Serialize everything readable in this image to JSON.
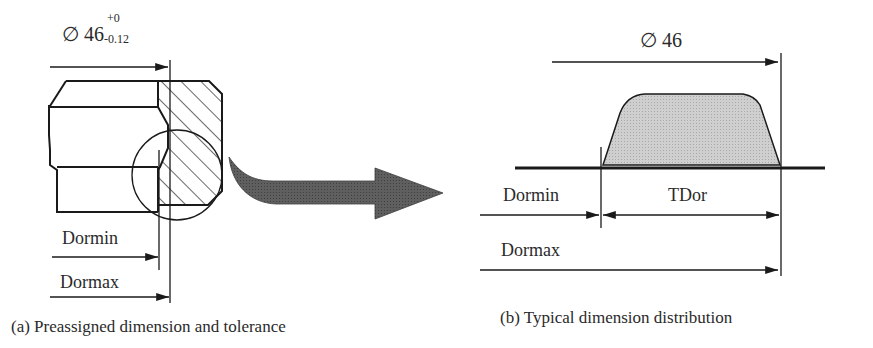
{
  "panel_a": {
    "dimension_symbol": "∅",
    "dimension_value": "46",
    "tolerance_upper": "+0",
    "tolerance_lower": "-0.12",
    "label_min": "Dormin",
    "label_max": "Dormax",
    "caption": "(a) Preassigned dimension and tolerance"
  },
  "panel_b": {
    "dimension_label": "∅ 46",
    "label_min": "Dormin",
    "label_tolerance": "TDor",
    "label_max": "Dormax",
    "caption": "(b) Typical dimension distribution"
  },
  "colors": {
    "line": "#1a1a1a",
    "hatch": "#1a1a1a",
    "arrow_fill": "#5a5a5a",
    "distribution_fill": "#c8c8c8"
  }
}
